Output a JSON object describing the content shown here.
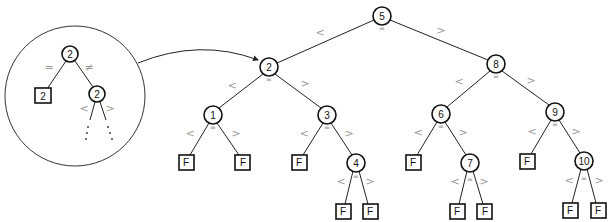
{
  "diagram": {
    "labels": {
      "less": "<",
      "greater": ">",
      "equal": "=",
      "not_equal": "≠",
      "fail": "F"
    },
    "nodes": [
      {
        "id": "n5",
        "value": "5",
        "x": 382,
        "y": 16
      },
      {
        "id": "n2",
        "value": "2",
        "x": 269,
        "y": 67
      },
      {
        "id": "n8",
        "value": "8",
        "x": 496,
        "y": 64
      },
      {
        "id": "n1",
        "value": "1",
        "x": 213,
        "y": 115
      },
      {
        "id": "n3",
        "value": "3",
        "x": 327,
        "y": 115
      },
      {
        "id": "n4",
        "value": "4",
        "x": 356,
        "y": 163
      },
      {
        "id": "n6",
        "value": "6",
        "x": 441,
        "y": 114
      },
      {
        "id": "n7",
        "value": "7",
        "x": 470,
        "y": 163
      },
      {
        "id": "n9",
        "value": "9",
        "x": 555,
        "y": 112
      },
      {
        "id": "n10",
        "value": "10",
        "x": 584,
        "y": 161
      }
    ],
    "leaves": [
      {
        "parent": "n1",
        "side": "less",
        "label": "F",
        "x": 186,
        "y": 162
      },
      {
        "parent": "n1",
        "side": "greater",
        "label": "F",
        "x": 243,
        "y": 162
      },
      {
        "parent": "n3",
        "side": "less",
        "label": "F",
        "x": 299,
        "y": 162
      },
      {
        "parent": "n4",
        "side": "less",
        "label": "F",
        "x": 343,
        "y": 211
      },
      {
        "parent": "n4",
        "side": "greater",
        "label": "F",
        "x": 370,
        "y": 211
      },
      {
        "parent": "n6",
        "side": "less",
        "label": "F",
        "x": 413,
        "y": 162
      },
      {
        "parent": "n7",
        "side": "less",
        "label": "F",
        "x": 457,
        "y": 211
      },
      {
        "parent": "n7",
        "side": "greater",
        "label": "F",
        "x": 485,
        "y": 211
      },
      {
        "parent": "n9",
        "side": "less",
        "label": "F",
        "x": 527,
        "y": 161
      },
      {
        "parent": "n10",
        "side": "less",
        "label": "F",
        "x": 570,
        "y": 210
      },
      {
        "parent": "n10",
        "side": "greater",
        "label": "F",
        "x": 598,
        "y": 210
      }
    ],
    "inset": {
      "description": "Magnified detail of node 2",
      "circle": {
        "cx": 75,
        "cy": 96,
        "r": 70
      },
      "top_node": {
        "value": "2",
        "x": 70,
        "y": 54
      },
      "equal_leaf": {
        "value": "2",
        "x": 43,
        "y": 96
      },
      "not_equal_node": {
        "value": "2",
        "x": 97,
        "y": 94
      },
      "equal_label": "=",
      "not_equal_label": "≠",
      "less_label": "<",
      "greater_label": ">"
    }
  }
}
